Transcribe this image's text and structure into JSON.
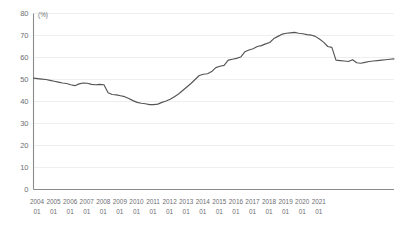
{
  "chart_data": {
    "type": "line",
    "title": "",
    "subtitle": "",
    "xlabel": "",
    "ylabel": "",
    "unit_label": "(%)",
    "ylim": [
      0,
      80
    ],
    "yticks": [
      0,
      10,
      20,
      30,
      40,
      50,
      60,
      70,
      80
    ],
    "ytick_labels": [
      "0",
      "10",
      "20",
      "30",
      "40",
      "50",
      "60",
      "70",
      "80"
    ],
    "grid": true,
    "grid_axis": "y",
    "legend": false,
    "legend_position": "none",
    "line_color": "#555555",
    "grid_color": "#eeeeee",
    "axis_color": "#8a8a8a",
    "tick_label_color": "#6d6e71",
    "x_tick_labels": [
      {
        "year": "2004",
        "month": "01"
      },
      {
        "year": "2005",
        "month": "01"
      },
      {
        "year": "2006",
        "month": "01"
      },
      {
        "year": "2007",
        "month": "01"
      },
      {
        "year": "2008",
        "month": "01"
      },
      {
        "year": "2009",
        "month": "01"
      },
      {
        "year": "2010",
        "month": "01"
      },
      {
        "year": "2011",
        "month": "01"
      },
      {
        "year": "2012",
        "month": "01"
      },
      {
        "year": "2013",
        "month": "01"
      },
      {
        "year": "2014",
        "month": "01"
      },
      {
        "year": "2015",
        "month": "01"
      },
      {
        "year": "2016",
        "month": "01"
      },
      {
        "year": "2017",
        "month": "01"
      },
      {
        "year": "2018",
        "month": "01"
      },
      {
        "year": "2019",
        "month": "01"
      },
      {
        "year": "2020",
        "month": "01"
      },
      {
        "year": "2021",
        "month": "01"
      }
    ],
    "x_start": "2004-01",
    "x_end": "2021-08",
    "x_interval": "quarterly",
    "series": [
      {
        "name": "value",
        "color": "#555555",
        "values": [
          50.6,
          50.4,
          50.2,
          50.0,
          49.6,
          49.2,
          48.8,
          48.4,
          48.2,
          47.6,
          47.2,
          48.0,
          48.4,
          48.3,
          47.8,
          47.6,
          47.8,
          47.6,
          44.0,
          43.2,
          43.0,
          42.6,
          42.2,
          41.4,
          40.4,
          39.6,
          39.2,
          39.0,
          38.6,
          38.6,
          38.8,
          39.6,
          40.2,
          41.0,
          42.2,
          43.4,
          45.0,
          46.6,
          48.2,
          50.0,
          51.8,
          52.4,
          52.6,
          53.6,
          55.4,
          56.0,
          56.4,
          58.8,
          59.2,
          59.6,
          60.2,
          62.6,
          63.4,
          64.0,
          65.0,
          65.4,
          66.2,
          66.8,
          68.6,
          69.6,
          70.6,
          71.0,
          71.2,
          71.4,
          71.0,
          70.8,
          70.4,
          70.2,
          69.6,
          68.4,
          67.0,
          65.0,
          64.6,
          58.8,
          58.6,
          58.4,
          58.2,
          59.0,
          57.6,
          57.4,
          57.8,
          58.2,
          58.4,
          58.6,
          58.8,
          59.0,
          59.2,
          59.4
        ]
      }
    ],
    "notable_points": {
      "start_value": 50.6,
      "minimum_value": 38.6,
      "minimum_at": "2009-01",
      "maximum_value": 71.4,
      "maximum_at": "2016-10",
      "end_value": 59.4
    }
  },
  "accessibility": {
    "figure_name": "time-series-line-chart"
  }
}
